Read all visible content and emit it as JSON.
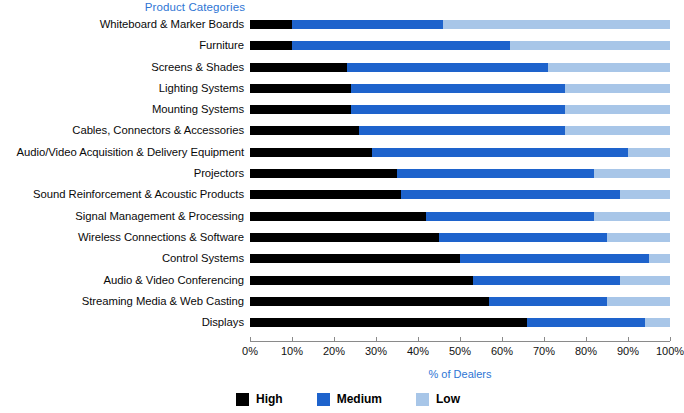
{
  "chart_data": {
    "type": "bar",
    "orientation": "horizontal",
    "stacked": true,
    "normalized_percent": true,
    "title": "",
    "ylabel": "Product Categories",
    "xlabel": "% of Dealers",
    "xlim": [
      0,
      100
    ],
    "xticks": [
      0,
      10,
      20,
      30,
      40,
      50,
      60,
      70,
      80,
      90,
      100
    ],
    "xtick_labels": [
      "0%",
      "10%",
      "20%",
      "30%",
      "40%",
      "50%",
      "60%",
      "70%",
      "80%",
      "90%",
      "100%"
    ],
    "grid": false,
    "legend_position": "bottom",
    "categories": [
      "Whiteboard & Marker Boards",
      "Furniture",
      "Screens & Shades",
      "Lighting Systems",
      "Mounting Systems",
      "Cables, Connectors & Accessories",
      "Audio/Video Acquisition & Delivery Equipment",
      "Projectors",
      "Sound Reinforcement & Acoustic Products",
      "Signal Management & Processing",
      "Wireless Connections & Software",
      "Control Systems",
      "Audio & Video Conferencing",
      "Streaming Media & Web Casting",
      "Displays"
    ],
    "series": [
      {
        "name": "High",
        "color": "#000000",
        "values": [
          10,
          10,
          23,
          24,
          24,
          26,
          29,
          35,
          36,
          42,
          45,
          50,
          53,
          57,
          66
        ]
      },
      {
        "name": "Medium",
        "color": "#1E63CC",
        "values": [
          36,
          52,
          48,
          51,
          51,
          49,
          61,
          47,
          52,
          40,
          40,
          45,
          35,
          28,
          28
        ]
      },
      {
        "name": "Low",
        "color": "#A8C6E8",
        "values": [
          54,
          38,
          29,
          25,
          25,
          25,
          10,
          18,
          12,
          18,
          15,
          5,
          12,
          15,
          6
        ]
      }
    ],
    "cumulative_boundaries": {
      "high_end": [
        10,
        10,
        23,
        24,
        24,
        26,
        29,
        35,
        36,
        42,
        45,
        50,
        53,
        57,
        66
      ],
      "medium_end": [
        46,
        62,
        71,
        75,
        75,
        75,
        90,
        82,
        88,
        82,
        85,
        95,
        88,
        85,
        94
      ]
    }
  },
  "legend": {
    "items": [
      {
        "label": "High",
        "color": "#000000"
      },
      {
        "label": "Medium",
        "color": "#1E63CC"
      },
      {
        "label": "Low",
        "color": "#A8C6E8"
      }
    ]
  },
  "colors": {
    "high": "#000000",
    "medium": "#1E63CC",
    "low": "#A8C6E8",
    "axis_title": "#2E75D4",
    "axis_line": "#8a8a8a",
    "background": "#FFFFFF"
  }
}
